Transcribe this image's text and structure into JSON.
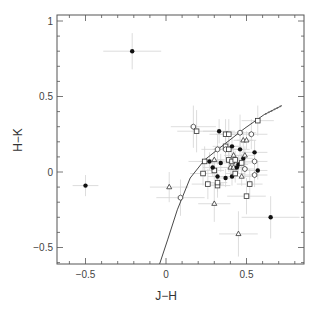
{
  "chart_data": {
    "type": "scatter",
    "title": "",
    "xlabel": "J−H",
    "ylabel": "H−K",
    "xlim": [
      -0.68,
      0.86
    ],
    "ylim": [
      -0.61,
      1.04
    ],
    "xticks": [
      -0.5,
      0,
      0.5
    ],
    "xtick_labels": [
      "−0.5",
      "0",
      "0.5"
    ],
    "yticks": [
      -0.5,
      0,
      0.5,
      1
    ],
    "ytick_labels": [
      "−0.5",
      "0",
      "0.5",
      "1"
    ],
    "minor_xtick_step": 0.1,
    "minor_ytick_step": 0.1,
    "grid": false,
    "legend": null,
    "markers": {
      "filled": "filled circle",
      "square": "open square",
      "hexagon": "open hexagon/circle",
      "triangle": "open triangle"
    },
    "points": [
      {
        "x": -0.21,
        "y": 0.8,
        "m": "filled",
        "ex": 0.18,
        "ey": 0.12
      },
      {
        "x": -0.5,
        "y": -0.09,
        "m": "filled",
        "ex": 0.08,
        "ey": 0.07
      },
      {
        "x": 0.65,
        "y": -0.3,
        "m": "filled",
        "ex": 0.18,
        "ey": 0.14
      },
      {
        "x": 0.45,
        "y": -0.41,
        "m": "triangle",
        "ex": 0.12,
        "ey": 0.15
      },
      {
        "x": 0.02,
        "y": -0.1,
        "m": "triangle",
        "ex": 0.12,
        "ey": 0.1
      },
      {
        "x": 0.09,
        "y": -0.17,
        "m": "hexagon",
        "ex": 0.15,
        "ey": 0.12
      },
      {
        "x": 0.3,
        "y": -0.21,
        "m": "triangle",
        "ex": 0.1,
        "ey": 0.12
      },
      {
        "x": 0.26,
        "y": -0.08,
        "m": "square",
        "ex": 0.1,
        "ey": 0.1
      },
      {
        "x": 0.32,
        "y": -0.09,
        "m": "square",
        "ex": 0.08,
        "ey": 0.08
      },
      {
        "x": 0.5,
        "y": -0.16,
        "m": "square",
        "ex": 0.12,
        "ey": 0.12
      },
      {
        "x": 0.52,
        "y": -0.08,
        "m": "square",
        "ex": 0.08,
        "ey": 0.1
      },
      {
        "x": 0.17,
        "y": 0.3,
        "m": "hexagon",
        "ex": 0.14,
        "ey": 0.14
      },
      {
        "x": 0.19,
        "y": 0.27,
        "m": "square",
        "ex": 0.12,
        "ey": 0.14
      },
      {
        "x": 0.33,
        "y": 0.27,
        "m": "filled",
        "ex": 0.1,
        "ey": 0.08
      },
      {
        "x": 0.37,
        "y": 0.25,
        "m": "square",
        "ex": 0.1,
        "ey": 0.1
      },
      {
        "x": 0.39,
        "y": 0.25,
        "m": "square",
        "ex": 0.08,
        "ey": 0.1
      },
      {
        "x": 0.46,
        "y": 0.26,
        "m": "hexagon",
        "ex": 0.1,
        "ey": 0.12
      },
      {
        "x": 0.53,
        "y": 0.25,
        "m": "hexagon",
        "ex": 0.1,
        "ey": 0.1
      },
      {
        "x": 0.57,
        "y": 0.34,
        "m": "square",
        "ex": 0.1,
        "ey": 0.1
      },
      {
        "x": 0.37,
        "y": 0.17,
        "m": "square",
        "ex": 0.08,
        "ey": 0.08
      },
      {
        "x": 0.48,
        "y": 0.21,
        "m": "triangle",
        "ex": 0.06,
        "ey": 0.06
      },
      {
        "x": 0.5,
        "y": 0.21,
        "m": "triangle",
        "ex": 0.06,
        "ey": 0.06
      },
      {
        "x": 0.32,
        "y": 0.15,
        "m": "hexagon",
        "ex": 0.1,
        "ey": 0.1
      },
      {
        "x": 0.37,
        "y": 0.15,
        "m": "hexagon",
        "ex": 0.08,
        "ey": 0.08
      },
      {
        "x": 0.39,
        "y": 0.15,
        "m": "square",
        "ex": 0.08,
        "ey": 0.08
      },
      {
        "x": 0.41,
        "y": 0.17,
        "m": "filled",
        "ex": 0.06,
        "ey": 0.06
      },
      {
        "x": 0.39,
        "y": 0.08,
        "m": "square",
        "ex": 0.08,
        "ey": 0.08
      },
      {
        "x": 0.41,
        "y": 0.07,
        "m": "square",
        "ex": 0.06,
        "ey": 0.06
      },
      {
        "x": 0.43,
        "y": 0.08,
        "m": "square",
        "ex": 0.06,
        "ey": 0.06
      },
      {
        "x": 0.46,
        "y": 0.15,
        "m": "filled",
        "ex": 0.06,
        "ey": 0.06
      },
      {
        "x": 0.48,
        "y": 0.09,
        "m": "filled",
        "ex": 0.06,
        "ey": 0.06
      },
      {
        "x": 0.55,
        "y": 0.13,
        "m": "filled",
        "ex": 0.08,
        "ey": 0.08
      },
      {
        "x": 0.55,
        "y": 0.07,
        "m": "hexagon",
        "ex": 0.08,
        "ey": 0.08
      },
      {
        "x": 0.24,
        "y": 0.07,
        "m": "square",
        "ex": 0.1,
        "ey": 0.1
      },
      {
        "x": 0.27,
        "y": 0.07,
        "m": "filled",
        "ex": 0.06,
        "ey": 0.06
      },
      {
        "x": 0.3,
        "y": 0.08,
        "m": "triangle",
        "ex": 0.06,
        "ey": 0.06
      },
      {
        "x": 0.34,
        "y": 0.06,
        "m": "filled",
        "ex": 0.06,
        "ey": 0.06
      },
      {
        "x": 0.42,
        "y": 0.11,
        "m": "triangle",
        "ex": 0.06,
        "ey": 0.06
      },
      {
        "x": 0.45,
        "y": 0.05,
        "m": "filled",
        "ex": 0.06,
        "ey": 0.06
      },
      {
        "x": 0.32,
        "y": -0.03,
        "m": "filled",
        "ex": 0.06,
        "ey": 0.06
      },
      {
        "x": 0.37,
        "y": -0.04,
        "m": "filled",
        "ex": 0.06,
        "ey": 0.06
      },
      {
        "x": 0.41,
        "y": -0.03,
        "m": "filled",
        "ex": 0.06,
        "ey": 0.06
      },
      {
        "x": 0.47,
        "y": -0.03,
        "m": "triangle",
        "ex": 0.06,
        "ey": 0.06
      },
      {
        "x": 0.47,
        "y": 0.06,
        "m": "square",
        "ex": 0.06,
        "ey": 0.06
      },
      {
        "x": 0.55,
        "y": -0.02,
        "m": "hexagon",
        "ex": 0.08,
        "ey": 0.08
      },
      {
        "x": 0.49,
        "y": 0.02,
        "m": "hexagon",
        "ex": 0.06,
        "ey": 0.06
      },
      {
        "x": 0.3,
        "y": 0.01,
        "m": "square",
        "ex": 0.06,
        "ey": 0.06
      },
      {
        "x": 0.4,
        "y": 0.03,
        "m": "triangle",
        "ex": 0.06,
        "ey": 0.06
      },
      {
        "x": 0.42,
        "y": 0.03,
        "m": "triangle",
        "ex": 0.06,
        "ey": 0.06
      },
      {
        "x": 0.44,
        "y": 0.03,
        "m": "filled",
        "ex": 0.06,
        "ey": 0.06
      },
      {
        "x": 0.29,
        "y": 0.03,
        "m": "filled",
        "ex": 0.06,
        "ey": 0.06
      },
      {
        "x": 0.23,
        "y": -0.01,
        "m": "square",
        "ex": 0.08,
        "ey": 0.08
      },
      {
        "x": 0.57,
        "y": 0.01,
        "m": "filled",
        "ex": 0.06,
        "ey": 0.06
      },
      {
        "x": 0.32,
        "y": -0.07,
        "m": "square",
        "ex": 0.06,
        "ey": 0.06
      },
      {
        "x": 0.43,
        "y": -0.01,
        "m": "square",
        "ex": 0.06,
        "ey": 0.06
      },
      {
        "x": 0.49,
        "y": 0.11,
        "m": "triangle",
        "ex": 0.06,
        "ey": 0.06
      }
    ],
    "curve": {
      "name": "locus",
      "x": [
        -0.04,
        0.01,
        0.07,
        0.15,
        0.24,
        0.37,
        0.49,
        0.61,
        0.72
      ],
      "y": [
        -0.61,
        -0.45,
        -0.25,
        -0.04,
        0.08,
        0.19,
        0.29,
        0.38,
        0.44
      ]
    }
  }
}
